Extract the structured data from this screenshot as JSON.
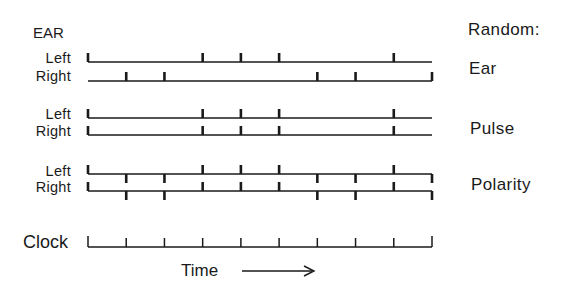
{
  "header": {
    "left_title": "EAR",
    "right_title": "Random:"
  },
  "groups": [
    {
      "name": "Ear",
      "rows": [
        {
          "label": "Left",
          "y": 62,
          "up_slots": [
            0,
            3,
            4,
            5,
            8
          ],
          "down_slots": []
        },
        {
          "label": "Right",
          "y": 81,
          "up_slots": [
            1,
            2,
            6,
            7,
            9
          ],
          "down_slots": []
        }
      ]
    },
    {
      "name": "Pulse",
      "rows": [
        {
          "label": "Left",
          "y": 118,
          "up_slots": [
            0,
            3,
            4,
            5,
            8
          ],
          "down_slots": []
        },
        {
          "label": "Right",
          "y": 135,
          "up_slots": [
            0,
            3,
            4,
            5,
            8
          ],
          "down_slots": []
        }
      ]
    },
    {
      "name": "Polarity",
      "rows": [
        {
          "label": "Left",
          "y": 174,
          "up_slots": [
            0,
            3,
            4,
            5,
            8
          ],
          "down_slots": [
            1,
            2,
            6,
            7,
            9
          ]
        },
        {
          "label": "Right",
          "y": 191,
          "up_slots": [
            0,
            3,
            4,
            5,
            8
          ],
          "down_slots": [
            1,
            2,
            6,
            7,
            9
          ]
        }
      ]
    }
  ],
  "clock": {
    "label": "Clock",
    "y": 247,
    "slots": [
      0,
      1,
      2,
      3,
      4,
      5,
      6,
      7,
      8,
      9
    ]
  },
  "axis": {
    "label": "Time",
    "arrow": "right-arrow"
  },
  "timeline": {
    "x_start": 88,
    "x_end": 432,
    "slot_count": 10
  },
  "colors": {
    "ink": "#1a1a1a",
    "background": "#ffffff"
  }
}
